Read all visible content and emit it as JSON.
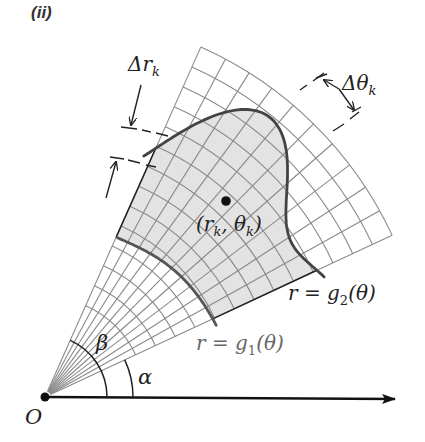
{
  "panel_label": "(ii)",
  "labels": {
    "delta_r": {
      "main": "Δr",
      "sub": "k"
    },
    "delta_theta": {
      "main": "Δθ",
      "sub": "k"
    },
    "point": {
      "open": "(r",
      "sub1": "k",
      "mid": ", θ",
      "sub2": "k",
      "close": ")"
    },
    "g2": {
      "lhs": "r",
      "eq": "=",
      "fn": "g",
      "sub": "2",
      "arg": "(θ)"
    },
    "g1": {
      "lhs": "r",
      "eq": "=",
      "fn": "g",
      "sub": "1",
      "arg": "(θ)"
    },
    "beta": "β",
    "alpha": "α",
    "origin": "O"
  },
  "geometry": {
    "origin": [
      45,
      397
    ],
    "alpha_deg": 25,
    "beta_deg": 66,
    "r_min": 100,
    "r_max": 383,
    "n_rings": 14,
    "n_rays": 10
  },
  "colors": {
    "grid": "#8a8a8a",
    "shade": "#e3e3e3",
    "curve": "#444444",
    "axis": "#111111"
  }
}
